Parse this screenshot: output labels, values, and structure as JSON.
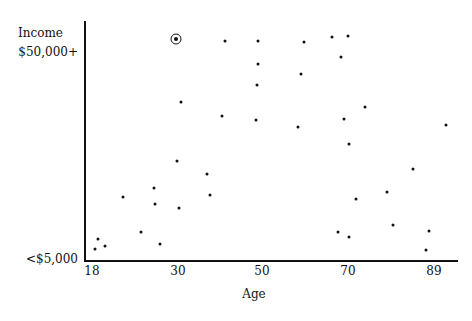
{
  "chart_data": {
    "type": "scatter",
    "title": "",
    "xlabel": "Age",
    "ylabel": "Income",
    "x_ticks": [
      {
        "label": "18",
        "px": 92
      },
      {
        "label": "30",
        "px": 178
      },
      {
        "label": "50",
        "px": 262
      },
      {
        "label": "70",
        "px": 348
      },
      {
        "label": "89",
        "px": 434
      }
    ],
    "y_ticks": [
      {
        "label": "$50,000+",
        "py": 53
      },
      {
        "label": "<$5,000",
        "py": 260
      }
    ],
    "xlim": [
      18,
      89
    ],
    "ylim": [
      "<$5,000",
      "$50,000+"
    ],
    "grid": false,
    "legend": null,
    "highlighted_point": {
      "age": 30,
      "income": 51000,
      "px": 176,
      "py": 39,
      "marker": "circled"
    },
    "points": [
      {
        "age": 30,
        "income": 51000,
        "px": 176,
        "py": 39,
        "highlight": true
      },
      {
        "age": 41,
        "income": 50500,
        "px": 225,
        "py": 41
      },
      {
        "age": 49,
        "income": 50500,
        "px": 258,
        "py": 41
      },
      {
        "age": 60,
        "income": 50300,
        "px": 304,
        "py": 42
      },
      {
        "age": 66,
        "income": 51200,
        "px": 332,
        "py": 37
      },
      {
        "age": 70,
        "income": 51400,
        "px": 348,
        "py": 36
      },
      {
        "age": 68,
        "income": 46800,
        "px": 341,
        "py": 57
      },
      {
        "age": 49,
        "income": 46000,
        "px": 258,
        "py": 64
      },
      {
        "age": 59,
        "income": 43800,
        "px": 301,
        "py": 74
      },
      {
        "age": 49,
        "income": 41400,
        "px": 257,
        "py": 85
      },
      {
        "age": 31,
        "income": 37700,
        "px": 181,
        "py": 102
      },
      {
        "age": 74,
        "income": 36600,
        "px": 365,
        "py": 107
      },
      {
        "age": 40,
        "income": 34600,
        "px": 222,
        "py": 116
      },
      {
        "age": 48,
        "income": 33700,
        "px": 256,
        "py": 120
      },
      {
        "age": 69,
        "income": 33900,
        "px": 344,
        "py": 119
      },
      {
        "age": 59,
        "income": 32200,
        "px": 298,
        "py": 127
      },
      {
        "age": 92,
        "income": 32600,
        "px": 446,
        "py": 125
      },
      {
        "age": 70,
        "income": 28500,
        "px": 349,
        "py": 144
      },
      {
        "age": 30,
        "income": 24500,
        "px": 177,
        "py": 161
      },
      {
        "age": 85,
        "income": 22800,
        "px": 413,
        "py": 169
      },
      {
        "age": 37,
        "income": 21600,
        "px": 207,
        "py": 174
      },
      {
        "age": 25,
        "income": 18600,
        "px": 154,
        "py": 188
      },
      {
        "age": 79,
        "income": 17800,
        "px": 387,
        "py": 192
      },
      {
        "age": 38,
        "income": 17100,
        "px": 210,
        "py": 195
      },
      {
        "age": 21,
        "income": 16700,
        "px": 123,
        "py": 197
      },
      {
        "age": 72,
        "income": 15400,
        "px": 356,
        "py": 199
      },
      {
        "age": 25,
        "income": 15100,
        "px": 155,
        "py": 204
      },
      {
        "age": 30,
        "income": 14200,
        "px": 179,
        "py": 208
      },
      {
        "age": 80,
        "income": 10400,
        "px": 393,
        "py": 225
      },
      {
        "age": 88,
        "income": 8900,
        "px": 429,
        "py": 231
      },
      {
        "age": 24,
        "income": 8700,
        "px": 141,
        "py": 232
      },
      {
        "age": 68,
        "income": 8700,
        "px": 338,
        "py": 232
      },
      {
        "age": 70,
        "income": 7600,
        "px": 349,
        "py": 237
      },
      {
        "age": 19,
        "income": 7300,
        "px": 98,
        "py": 239
      },
      {
        "age": 26,
        "income": 6200,
        "px": 160,
        "py": 244
      },
      {
        "age": 20,
        "income": 5800,
        "px": 105,
        "py": 246
      },
      {
        "age": 18,
        "income": 5100,
        "px": 95,
        "py": 249
      },
      {
        "age": 87,
        "income": 5000,
        "px": 426,
        "py": 250
      }
    ]
  }
}
